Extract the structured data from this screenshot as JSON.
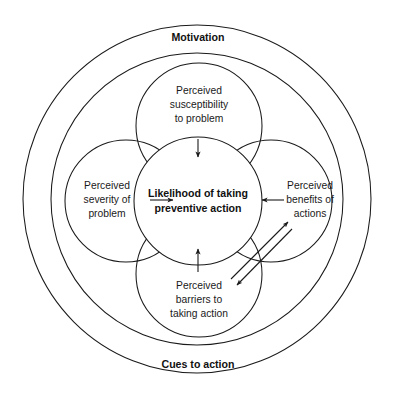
{
  "diagram": {
    "background_color": "#ffffff",
    "stroke_color": "#1a1a1a",
    "text_color": "#1a1a1a",
    "outer_ring_top_label": "Motivation",
    "outer_ring_bottom_label": "Cues to action",
    "core": {
      "line1": "Likelihood of taking",
      "line2": "preventive action",
      "bold": true
    },
    "lobes": [
      {
        "id": "perceived-susceptibility",
        "position": "top",
        "line1": "Perceived",
        "line2": "susceptibility",
        "line3": "to problem"
      },
      {
        "id": "perceived-severity",
        "position": "left",
        "line1": "Perceived",
        "line2": "severity of",
        "line3": "problem"
      },
      {
        "id": "perceived-benefits",
        "position": "right",
        "line1": "Perceived",
        "line2": "benefits of",
        "line3": "actions"
      },
      {
        "id": "perceived-barriers",
        "position": "bottom",
        "line1": "Perceived",
        "line2": "barriers to",
        "line3": "taking action"
      }
    ],
    "arrows": [
      {
        "id": "susceptibility-to-core",
        "from": "perceived-susceptibility",
        "to": "core",
        "direction": "down"
      },
      {
        "id": "severity-to-core",
        "from": "perceived-severity",
        "to": "core",
        "direction": "right"
      },
      {
        "id": "benefits-to-core",
        "from": "perceived-benefits",
        "to": "core",
        "direction": "left"
      },
      {
        "id": "barriers-to-core",
        "from": "perceived-barriers",
        "to": "core",
        "direction": "up"
      },
      {
        "id": "barriers-to-benefits",
        "from": "perceived-barriers",
        "to": "perceived-benefits",
        "direction": "up-right"
      },
      {
        "id": "benefits-to-barriers",
        "from": "perceived-benefits",
        "to": "perceived-barriers",
        "direction": "down-left"
      }
    ]
  }
}
